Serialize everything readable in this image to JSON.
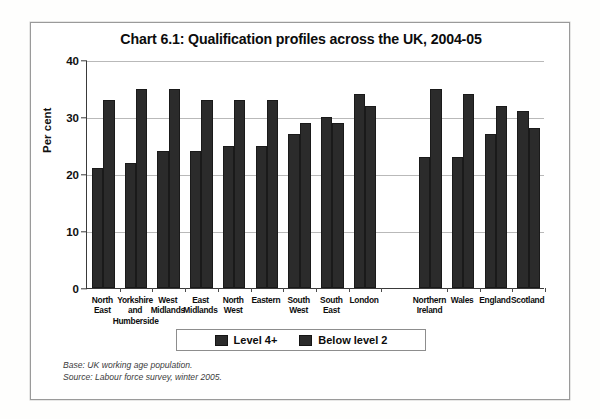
{
  "chart_data": {
    "type": "bar",
    "title": "Chart 6.1: Qualification profiles across the UK, 2004-05",
    "xlabel": "",
    "ylabel": "Per cent",
    "ylim": [
      0,
      40
    ],
    "yticks": [
      0,
      10,
      20,
      30,
      40
    ],
    "grid": true,
    "legend_position": "bottom-center",
    "categories": [
      "North East",
      "Yorkshire and Humberside",
      "West Midlands",
      "East Midlands",
      "North West",
      "Eastern",
      "South West",
      "South East",
      "London",
      "Northern Ireland",
      "Wales",
      "England",
      "Scotland"
    ],
    "category_lines": [
      [
        "North",
        "East"
      ],
      [
        "Yorkshire",
        "and",
        "Humberside"
      ],
      [
        "West",
        "Midlands"
      ],
      [
        "East",
        "Midlands"
      ],
      [
        "North",
        "West"
      ],
      [
        "Eastern"
      ],
      [
        "South",
        "West"
      ],
      [
        "South",
        "East"
      ],
      [
        "London"
      ],
      [
        "Northern",
        "Ireland"
      ],
      [
        "Wales"
      ],
      [
        "England"
      ],
      [
        "Scotland"
      ]
    ],
    "group_break_after_index": 8,
    "series": [
      {
        "name": "Level 4+",
        "color": "#2b2b2b",
        "values": [
          21,
          22,
          24,
          24,
          25,
          25,
          27,
          30,
          34,
          23,
          23,
          27,
          31
        ]
      },
      {
        "name": "Below level 2",
        "color": "#2b2b2b",
        "values": [
          33,
          35,
          35,
          33,
          33,
          33,
          29,
          29,
          32,
          35,
          34,
          32,
          28
        ]
      }
    ],
    "notes": [
      "Base: UK working age population.",
      "Source: Labour force survey, winter 2005."
    ]
  },
  "legend": {
    "items": [
      {
        "label": "Level 4+"
      },
      {
        "label": "Below level 2"
      }
    ]
  },
  "colors": {
    "bar": "#2b2b2b",
    "axis": "#3a3a3a",
    "grid": "#b9b9b9",
    "frame": "#9a9a9a",
    "background": "#ffffff"
  }
}
